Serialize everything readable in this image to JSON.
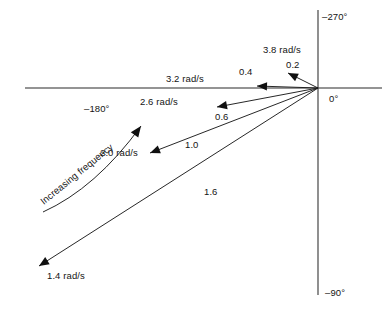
{
  "figure": {
    "origin": {
      "x": 318,
      "y": 88
    },
    "axes": {
      "horizontal": {
        "x1": 25,
        "y1": 88,
        "x2": 382,
        "y2": 88
      },
      "vertical": {
        "x1": 318,
        "y1": 10,
        "x2": 318,
        "y2": 295
      }
    },
    "axis_labels": [
      {
        "name": "axis-label-minus-270",
        "text": "–270°",
        "x": 322,
        "y": 11
      },
      {
        "name": "axis-label-minus-180",
        "text": "–180°",
        "x": 84,
        "y": 103
      },
      {
        "name": "axis-label-0",
        "text": "0°",
        "x": 329,
        "y": 93
      },
      {
        "name": "axis-label-minus-90",
        "text": "–90°",
        "x": 325,
        "y": 287
      }
    ],
    "annotation": {
      "name": "increasing-frequency-annotation",
      "text": "Increasing frequency",
      "x": 38,
      "y": 198,
      "rotation": -39,
      "curve": {
        "x1": 43,
        "y1": 212,
        "cx": 96,
        "cy": 188,
        "x2": 141,
        "y2": 126
      }
    },
    "colors": {
      "axis": "#2b2b2b",
      "vector": "#1b1b1b",
      "text": "#141414",
      "background": "#ffffff"
    }
  },
  "chart_data": {
    "type": "scatter",
    "xlabel": "",
    "ylabel": "",
    "grid": false,
    "legend": null,
    "angle_ticks": [
      "–270°",
      "–180°",
      "0°",
      "–90°"
    ],
    "annotations": [
      "Increasing frequency"
    ],
    "series": [
      {
        "name": "phasors",
        "points": [
          {
            "frequency_label": "3.8 rad/s",
            "magnitude_label": "0.2",
            "tip_x": 288,
            "tip_y": 73,
            "freq_label_x": 263,
            "freq_label_y": 44,
            "mag_label_x": 286,
            "mag_label_y": 59
          },
          {
            "frequency_label": "3.2 rad/s",
            "magnitude_label": "0.4",
            "tip_x": 257,
            "tip_y": 86,
            "freq_label_x": 166,
            "freq_label_y": 73,
            "mag_label_x": 239,
            "mag_label_y": 66
          },
          {
            "frequency_label": "2.6 rad/s",
            "magnitude_label": "0.6",
            "tip_x": 217,
            "tip_y": 107,
            "freq_label_x": 140,
            "freq_label_y": 96,
            "mag_label_x": 215,
            "mag_label_y": 111
          },
          {
            "frequency_label": "2.0 rad/s",
            "magnitude_label": "1.0",
            "tip_x": 150,
            "tip_y": 153,
            "freq_label_x": 100,
            "freq_label_y": 147,
            "mag_label_x": 185,
            "mag_label_y": 139
          },
          {
            "frequency_label": "1.4 rad/s",
            "magnitude_label": "1.6",
            "tip_x": 39,
            "tip_y": 266,
            "freq_label_x": 47,
            "freq_label_y": 270,
            "mag_label_x": 204,
            "mag_label_y": 186
          }
        ]
      }
    ]
  }
}
